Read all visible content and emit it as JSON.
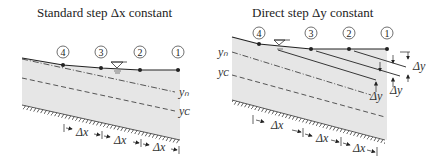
{
  "left_panel": {
    "title": "Standard step Δx constant",
    "stations": [
      "4",
      "3",
      "2",
      "1"
    ],
    "depth_labels": {
      "normal": "yₙ",
      "critical": "yᴄ"
    },
    "spacing_labels": [
      "Δx",
      "Δx",
      "Δx"
    ]
  },
  "right_panel": {
    "title": "Direct step Δy constant",
    "stations": [
      "4",
      "3",
      "2",
      "1"
    ],
    "depth_labels": {
      "normal": "yₙ",
      "critical": "yᴄ"
    },
    "depth_step_labels": [
      "Δy",
      "Δy",
      "Δy"
    ],
    "spacing_labels": [
      "Δx",
      "Δx",
      "Δx"
    ]
  },
  "colors": {
    "water_fill": "#e6e6e6",
    "line": "#222222",
    "text": "#222222"
  }
}
